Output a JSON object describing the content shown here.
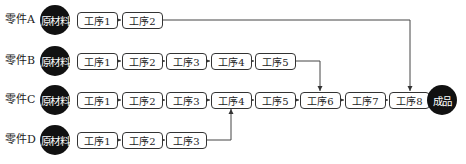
{
  "diagram": {
    "type": "process-flow",
    "raw_material_label": "原材料",
    "finished_label": "成品",
    "rows": [
      {
        "part": "零件A",
        "steps": [
          "工序1",
          "工序2"
        ],
        "feeds_into": "工序8"
      },
      {
        "part": "零件B",
        "steps": [
          "工序1",
          "工序2",
          "工序3",
          "工序4",
          "工序5"
        ],
        "feeds_into": "工序6"
      },
      {
        "part": "零件C",
        "steps": [
          "工序1",
          "工序2",
          "工序3",
          "工序4",
          "工序5",
          "工序6",
          "工序7",
          "工序8"
        ],
        "feeds_into": "成品"
      },
      {
        "part": "零件D",
        "steps": [
          "工序1",
          "工序2",
          "工序3"
        ],
        "feeds_into": "工序4"
      }
    ],
    "colors": {
      "circle": "#111111",
      "line": "#444444",
      "box_border": "#333333"
    }
  }
}
